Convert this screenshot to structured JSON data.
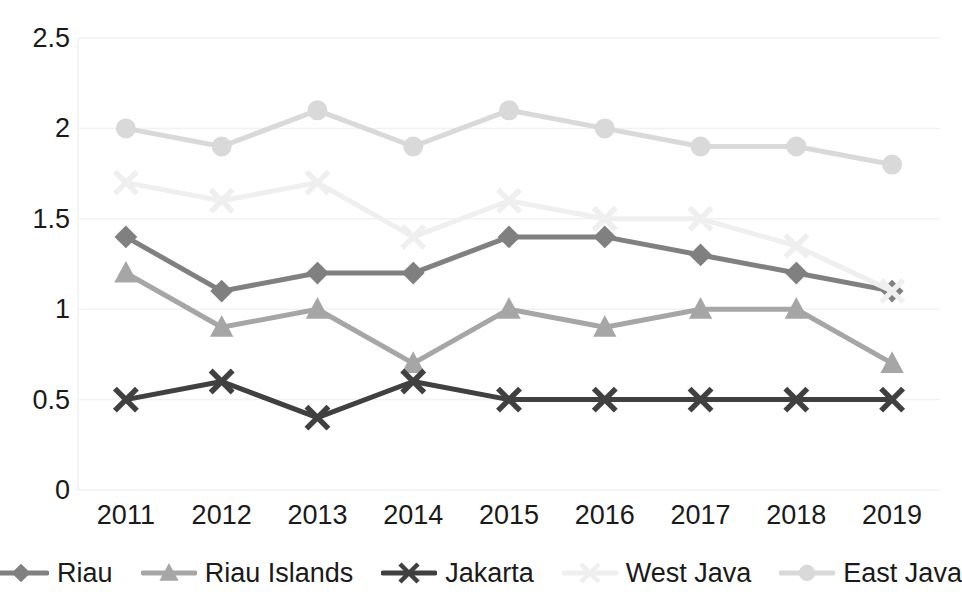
{
  "chart_data": {
    "type": "line",
    "title": "",
    "xlabel": "",
    "ylabel": "",
    "categories": [
      "2011",
      "2012",
      "2013",
      "2014",
      "2015",
      "2016",
      "2017",
      "2018",
      "2019"
    ],
    "ylim": [
      0,
      2.5
    ],
    "y_ticks": [
      "0",
      "0.5",
      "1",
      "1.5",
      "2",
      "2.5"
    ],
    "y_tick_values": [
      0,
      0.5,
      1,
      1.5,
      2,
      2.5
    ],
    "grid": true,
    "grid_axis": "y",
    "legend_position": "bottom",
    "series": [
      {
        "name": "Riau",
        "marker": "diamond",
        "color": "#808080",
        "values": [
          1.4,
          1.1,
          1.2,
          1.2,
          1.4,
          1.4,
          1.3,
          1.2,
          1.1
        ]
      },
      {
        "name": "Riau Islands",
        "marker": "triangle",
        "color": "#a6a6a6",
        "values": [
          1.2,
          0.9,
          1.0,
          0.7,
          1.0,
          0.9,
          1.0,
          1.0,
          0.7
        ]
      },
      {
        "name": "Jakarta",
        "marker": "x",
        "color": "#404040",
        "values": [
          0.5,
          0.6,
          0.4,
          0.6,
          0.5,
          0.5,
          0.5,
          0.5,
          0.5
        ]
      },
      {
        "name": "West Java",
        "marker": "x",
        "color": "#efefef",
        "values": [
          1.7,
          1.6,
          1.7,
          1.4,
          1.6,
          1.5,
          1.5,
          1.35,
          1.1
        ]
      },
      {
        "name": "East Java",
        "marker": "circle",
        "color": "#d9d9d9",
        "values": [
          2.0,
          1.9,
          2.1,
          1.9,
          2.1,
          2.0,
          1.9,
          1.9,
          1.8
        ]
      }
    ]
  },
  "legend": {
    "items": [
      {
        "label": "Riau"
      },
      {
        "label": "Riau Islands"
      },
      {
        "label": "Jakarta"
      },
      {
        "label": "West Java"
      },
      {
        "label": "East Java"
      }
    ]
  },
  "axis": {
    "y_labels": [
      "2.5",
      "2",
      "1.5",
      "1",
      "0.5",
      "0"
    ],
    "x_labels": [
      "2011",
      "2012",
      "2013",
      "2014",
      "2015",
      "2016",
      "2017",
      "2018",
      "2019"
    ]
  },
  "colors": {
    "axis_text": "#1a1a1a",
    "gridline": "#f2f2f2",
    "background": "#ffffff"
  }
}
